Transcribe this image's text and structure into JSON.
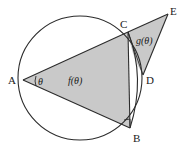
{
  "figure": {
    "kind": "geometry-diagram",
    "background_color": "#ffffff",
    "stroke_color": "#2b2b2b",
    "fill_color": "#c9c9c9",
    "points": {
      "A": {
        "label": "A",
        "x": 23,
        "y": 80,
        "label_x": 8,
        "label_y": 84
      },
      "B": {
        "label": "B",
        "x": 130,
        "y": 128,
        "label_x": 133,
        "label_y": 142
      },
      "C": {
        "label": "C",
        "x": 128,
        "y": 32,
        "label_x": 122,
        "label_y": 27
      },
      "D": {
        "label": "D",
        "x": 143,
        "y": 75,
        "label_x": 146,
        "label_y": 83
      },
      "E": {
        "label": "E",
        "x": 168,
        "y": 14,
        "label_x": 170,
        "label_y": 13
      }
    },
    "circle": {
      "cx": 80,
      "cy": 78,
      "r": 62
    },
    "region_labels": {
      "inner": {
        "text": "f(θ)",
        "x": 80,
        "y": 80
      },
      "outer": {
        "text": "g(θ)",
        "x": 146,
        "y": 40
      }
    },
    "angle_label": {
      "text": "θ",
      "x": 41,
      "y": 82
    },
    "markers": {
      "angle_arc_at_A": "theta-arc",
      "right_angle_at_B": "right-angle-square"
    }
  }
}
